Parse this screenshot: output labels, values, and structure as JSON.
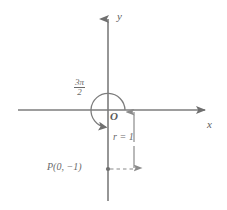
{
  "figure": {
    "type": "math-diagram",
    "background_color": "#ffffff",
    "line_color": "#7c7c7c",
    "text_color": "#6a6a6a"
  },
  "axes": {
    "x_label": "x",
    "y_label": "y",
    "origin_label": "O",
    "x_axis": {
      "start_px": 18,
      "end_px": 212,
      "y_px": 110,
      "arrow": "right"
    },
    "y_axis": {
      "start_px": 12,
      "end_px": 201,
      "x_px": 108,
      "arrow": "up"
    }
  },
  "angle": {
    "numerator": "3π",
    "denominator": "2",
    "value": "3π/2",
    "direction": "counterclockwise",
    "sweep_degrees": 270,
    "arc_radius_px": 17
  },
  "radius_marker": {
    "label": "r = 1",
    "value": 1,
    "arrow_style": "double-headed-vertical",
    "x_px": 134,
    "top_px": 110,
    "bottom_px": 170
  },
  "point": {
    "label": "P(0, −1)",
    "x": 0,
    "y": -1,
    "px": 108,
    "py": 169,
    "connector": "dashed"
  }
}
